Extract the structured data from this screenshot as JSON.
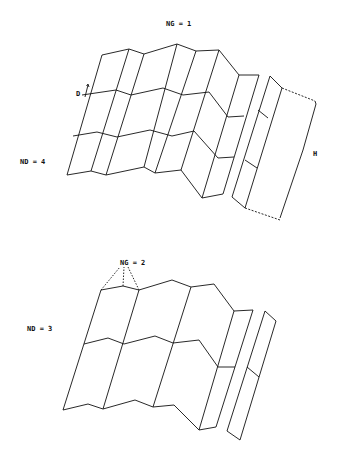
{
  "diagram": {
    "top_figure": {
      "label_ng": "NG = 1",
      "label_nd": "ND = 4",
      "label_d": "D",
      "label_h": "H"
    },
    "bottom_figure": {
      "label_ng": "NG = 2",
      "label_nd": "ND = 3"
    },
    "colors": {
      "line": "#111111",
      "background": "#ffffff"
    }
  }
}
